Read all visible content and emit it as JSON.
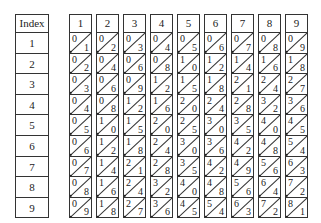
{
  "index_column": {
    "header": "Index",
    "rows": [
      "1",
      "2",
      "3",
      "4",
      "5",
      "6",
      "7",
      "8",
      "9"
    ]
  },
  "bones": [
    {
      "header": "1",
      "cells": [
        [
          "0",
          "1"
        ],
        [
          "0",
          "2"
        ],
        [
          "0",
          "3"
        ],
        [
          "0",
          "4"
        ],
        [
          "0",
          "5"
        ],
        [
          "0",
          "6"
        ],
        [
          "0",
          "7"
        ],
        [
          "0",
          "8"
        ],
        [
          "0",
          "9"
        ]
      ]
    },
    {
      "header": "2",
      "cells": [
        [
          "0",
          "2"
        ],
        [
          "0",
          "4"
        ],
        [
          "0",
          "6"
        ],
        [
          "0",
          "8"
        ],
        [
          "1",
          "0"
        ],
        [
          "1",
          "2"
        ],
        [
          "1",
          "4"
        ],
        [
          "1",
          "6"
        ],
        [
          "1",
          "8"
        ]
      ]
    },
    {
      "header": "3",
      "cells": [
        [
          "0",
          "3"
        ],
        [
          "0",
          "6"
        ],
        [
          "0",
          "9"
        ],
        [
          "1",
          "2"
        ],
        [
          "1",
          "5"
        ],
        [
          "1",
          "8"
        ],
        [
          "2",
          "1"
        ],
        [
          "2",
          "4"
        ],
        [
          "2",
          "7"
        ]
      ]
    },
    {
      "header": "4",
      "cells": [
        [
          "0",
          "4"
        ],
        [
          "0",
          "8"
        ],
        [
          "1",
          "2"
        ],
        [
          "1",
          "6"
        ],
        [
          "2",
          "0"
        ],
        [
          "2",
          "4"
        ],
        [
          "2",
          "8"
        ],
        [
          "3",
          "2"
        ],
        [
          "3",
          "6"
        ]
      ]
    },
    {
      "header": "5",
      "cells": [
        [
          "0",
          "5"
        ],
        [
          "1",
          "0"
        ],
        [
          "1",
          "5"
        ],
        [
          "2",
          "0"
        ],
        [
          "2",
          "5"
        ],
        [
          "3",
          "0"
        ],
        [
          "3",
          "5"
        ],
        [
          "4",
          "0"
        ],
        [
          "4",
          "5"
        ]
      ]
    },
    {
      "header": "6",
      "cells": [
        [
          "0",
          "6"
        ],
        [
          "1",
          "2"
        ],
        [
          "1",
          "8"
        ],
        [
          "2",
          "4"
        ],
        [
          "3",
          "0"
        ],
        [
          "3",
          "6"
        ],
        [
          "4",
          "2"
        ],
        [
          "4",
          "8"
        ],
        [
          "5",
          "4"
        ]
      ]
    },
    {
      "header": "7",
      "cells": [
        [
          "0",
          "7"
        ],
        [
          "1",
          "4"
        ],
        [
          "2",
          "1"
        ],
        [
          "2",
          "8"
        ],
        [
          "3",
          "5"
        ],
        [
          "4",
          "2"
        ],
        [
          "4",
          "9"
        ],
        [
          "5",
          "6"
        ],
        [
          "6",
          "3"
        ]
      ]
    },
    {
      "header": "8",
      "cells": [
        [
          "0",
          "8"
        ],
        [
          "1",
          "6"
        ],
        [
          "2",
          "4"
        ],
        [
          "3",
          "2"
        ],
        [
          "4",
          "0"
        ],
        [
          "4",
          "8"
        ],
        [
          "5",
          "6"
        ],
        [
          "6",
          "4"
        ],
        [
          "7",
          "2"
        ]
      ]
    },
    {
      "header": "9",
      "cells": [
        [
          "0",
          "9"
        ],
        [
          "1",
          "8"
        ],
        [
          "2",
          "7"
        ],
        [
          "3",
          "6"
        ],
        [
          "4",
          "5"
        ],
        [
          "5",
          "4"
        ],
        [
          "6",
          "3"
        ],
        [
          "7",
          "2"
        ],
        [
          "8",
          "1"
        ]
      ]
    }
  ]
}
